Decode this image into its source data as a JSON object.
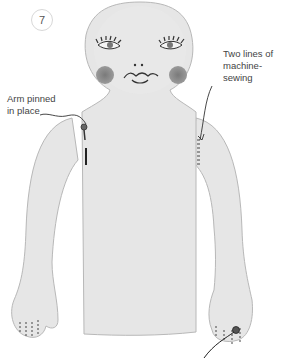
{
  "step": {
    "number": "7"
  },
  "callouts": {
    "arm_pinned": {
      "line1": "Arm pinned",
      "line2": "in place"
    },
    "machine_sewing": {
      "line1": "Two lines of",
      "line2": "machine-sewing"
    }
  },
  "colors": {
    "fabric": "#e6e6e6",
    "outline": "#b8b8b8",
    "cheek": "#8a8a8a",
    "stitch": "#444444",
    "text": "#444444"
  }
}
